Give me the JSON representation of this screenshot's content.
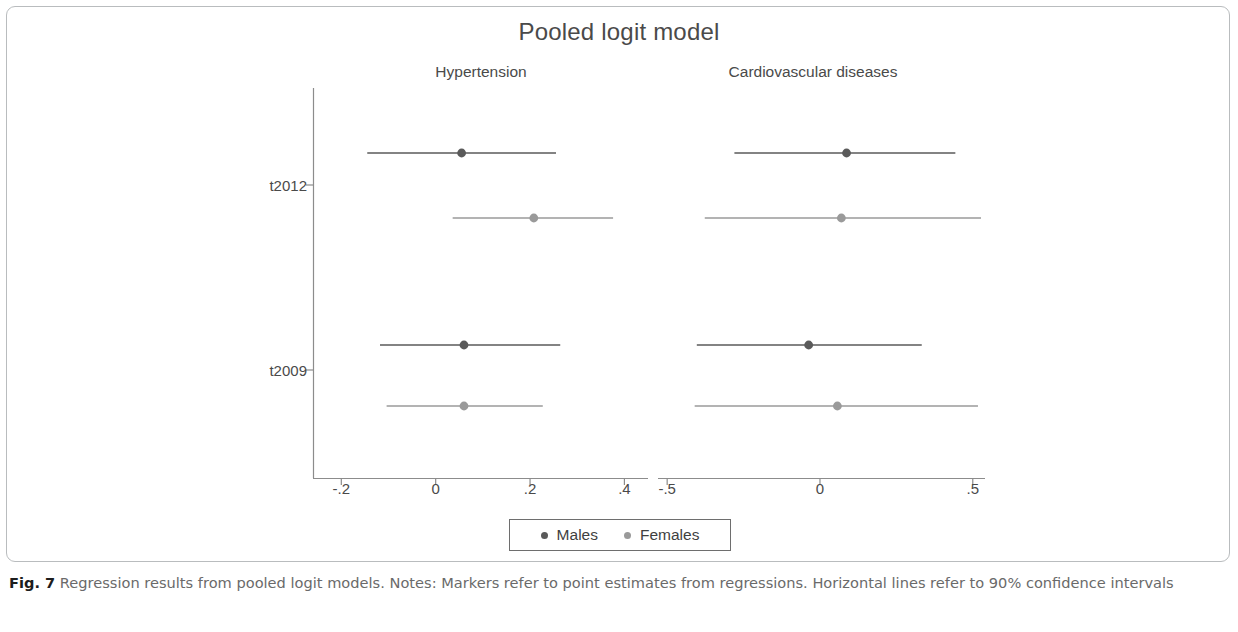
{
  "figure": {
    "caption_label": "Fig. 7",
    "caption_text": " Regression results from pooled logit models. Notes: Markers refer to point estimates from regressions. Horizontal lines refer to 90% confidence intervals"
  },
  "legend": {
    "items": [
      {
        "label": "Males",
        "color": "#5a5a5a"
      },
      {
        "label": "Females",
        "color": "#9a9a9a"
      }
    ]
  },
  "chart_data": {
    "type": "scatter",
    "title": "Pooled logit model",
    "xlabel": "",
    "ylabel": "",
    "grid": false,
    "legend_position": "bottom",
    "orientation": "horizontal",
    "error_bars": "90% confidence intervals",
    "categories": [
      "t2012",
      "t2009"
    ],
    "panels": [
      {
        "name": "Hypertension",
        "xlim": [
          -0.26,
          0.45
        ],
        "xticks": [
          -0.2,
          0,
          0.2,
          0.4
        ],
        "xtick_labels": [
          "-.2",
          "0",
          ".2",
          ".4"
        ],
        "series": [
          {
            "name": "Males",
            "color": "#5a5a5a",
            "points": [
              {
                "category": "t2012",
                "estimate": 0.055,
                "ci_low": -0.145,
                "ci_high": 0.255
              },
              {
                "category": "t2009",
                "estimate": 0.06,
                "ci_low": -0.118,
                "ci_high": 0.264
              }
            ]
          },
          {
            "name": "Females",
            "color": "#9a9a9a",
            "points": [
              {
                "category": "t2012",
                "estimate": 0.208,
                "ci_low": 0.036,
                "ci_high": 0.376
              },
              {
                "category": "t2009",
                "estimate": 0.06,
                "ci_low": -0.104,
                "ci_high": 0.227
              }
            ]
          }
        ]
      },
      {
        "name": "Cardiovascular diseases",
        "xlim": [
          -0.53,
          0.54
        ],
        "xticks": [
          -0.5,
          0,
          0.5
        ],
        "xtick_labels": [
          "-.5",
          "0",
          ".5"
        ],
        "series": [
          {
            "name": "Males",
            "color": "#5a5a5a",
            "points": [
              {
                "category": "t2012",
                "estimate": 0.087,
                "ci_low": -0.28,
                "ci_high": 0.443
              },
              {
                "category": "t2009",
                "estimate": -0.037,
                "ci_low": -0.403,
                "ci_high": 0.333
              }
            ]
          },
          {
            "name": "Females",
            "color": "#9a9a9a",
            "points": [
              {
                "category": "t2012",
                "estimate": 0.07,
                "ci_low": -0.377,
                "ci_high": 0.527
              },
              {
                "category": "t2009",
                "estimate": 0.057,
                "ci_low": -0.41,
                "ci_high": 0.517
              }
            ]
          }
        ]
      }
    ]
  }
}
